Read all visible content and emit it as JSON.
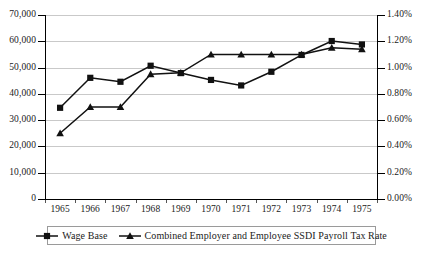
{
  "chart_data": {
    "type": "line",
    "title": "",
    "xlabel": "",
    "ylabel": "",
    "grid": true,
    "legend_position": "bottom",
    "categories": [
      "1965",
      "1966",
      "1967",
      "1968",
      "1969",
      "1970",
      "1971",
      "1972",
      "1973",
      "1974",
      "1975"
    ],
    "x_tick_labels": [
      "1965",
      "1966",
      "1967",
      "1968",
      "1969",
      "1970",
      "1971",
      "1972",
      "1973",
      "1974",
      "1975"
    ],
    "axes": {
      "left": {
        "label": "",
        "ylim": [
          0,
          70000
        ],
        "tick_values": [
          0,
          10000,
          20000,
          30000,
          40000,
          50000,
          60000,
          70000
        ],
        "tick_labels": [
          "0",
          "10,000",
          "20,000",
          "30,000",
          "40,000",
          "50,000",
          "60,000",
          "70,000"
        ]
      },
      "right": {
        "label": "",
        "ylim": [
          0,
          1.4
        ],
        "tick_values": [
          0,
          0.2,
          0.4,
          0.6,
          0.8,
          1.0,
          1.2,
          1.4
        ],
        "tick_labels": [
          "0.00%",
          "0.20%",
          "0.40%",
          "0.60%",
          "0.80%",
          "1.00%",
          "1.20%",
          "1.40%"
        ]
      }
    },
    "series": [
      {
        "name": "Wage Base",
        "axis": "left",
        "marker": "square",
        "color": "#111111",
        "values": [
          34700,
          46100,
          44600,
          50700,
          47900,
          45300,
          43200,
          48400,
          54800,
          60100,
          58800
        ]
      },
      {
        "name": "Combined Employer and Employee SSDI Payroll Tax Rate",
        "axis": "right",
        "marker": "triangle",
        "color": "#111111",
        "values": [
          0.5,
          0.7,
          0.7,
          0.95,
          0.96,
          1.1,
          1.1,
          1.1,
          1.1,
          1.15,
          1.14
        ]
      }
    ]
  },
  "legend": {
    "items": [
      {
        "label": "Wage Base",
        "marker": "square"
      },
      {
        "label": "Combined Employer and Employee SSDI Payroll Tax Rate",
        "marker": "triangle"
      }
    ]
  }
}
